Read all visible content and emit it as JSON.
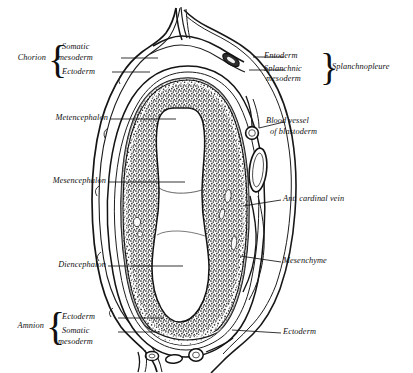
{
  "figure": {
    "ink_color": "#101010",
    "background_color": "#ffffff",
    "tissue_color": "#3a3a3a",
    "lumen_color": "#ffffff"
  },
  "labels": {
    "chorion": "Chorion",
    "somatic_mesoderm_top_1": "Somatic",
    "somatic_mesoderm_top_2": "mesoderm",
    "ectoderm_top": "Ectoderm",
    "entoderm": "Entoderm",
    "splanchnic_mesoderm_1": "Splanchnic",
    "splanchnic_mesoderm_2": "mesoderm",
    "splanchnopleure": "Splanchnopleure",
    "metencephalon": "Metencephalon",
    "blood_vessel_1": "Blood vessel",
    "blood_vessel_2": "of blastoderm",
    "mesencephalon": "Mesencephalon",
    "ant_cardinal_vein": "Ant. cardinal vein",
    "diencephalon": "Diencephalon",
    "mesenchyme": "Mesenchyme",
    "amnion": "Amnion",
    "ectoderm_bottom_left": "Ectoderm",
    "somatic_mesoderm_bottom_1": "Somatic",
    "somatic_mesoderm_bottom_2": "mesoderm",
    "ectoderm_bottom_right": "Ectoderm"
  },
  "braces": {
    "chorion_brace": "{",
    "splanchnopleure_brace": "}",
    "amnion_brace": "{"
  }
}
